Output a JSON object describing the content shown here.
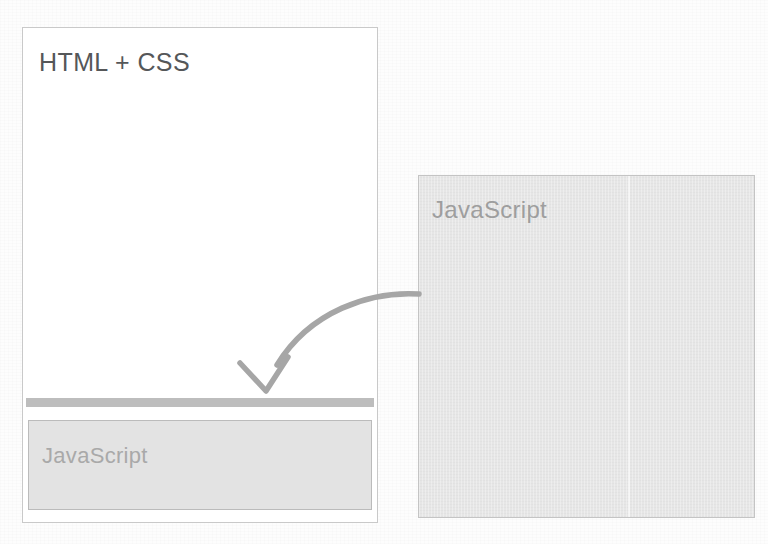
{
  "diagram": {
    "title_text": "HTML + CSS",
    "colors": {
      "page_background": "#fdfdfd",
      "panel_border": "#c9c9c9",
      "title_text": "#555759",
      "gray_bar": "#bdbdbd",
      "js_box_fill": "#e3e3e3",
      "js_box_border": "#bbbbbb",
      "js_label_text": "#a9a9a9",
      "right_panel_fill": "#e6e6e6",
      "right_panel_border": "#c4c4c4",
      "right_panel_text": "#9e9e9e",
      "arrow_stroke": "#a6a6a6"
    },
    "left_panel": {
      "label": "HTML + CSS",
      "separator_bar_name": "gray-separator-bar",
      "js_box": {
        "label": "JavaScript"
      }
    },
    "right_panel": {
      "label": "JavaScript"
    },
    "arrow": {
      "name": "curved-arrow",
      "description": "curved arrow pointing from the JavaScript panel down into the left panel"
    }
  }
}
